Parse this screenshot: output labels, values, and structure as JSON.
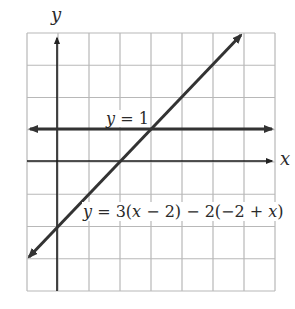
{
  "chart_data": {
    "type": "line",
    "title": "",
    "xlabel": "x",
    "ylabel": "y",
    "xlim": [
      -1,
      7
    ],
    "ylim": [
      -4,
      4
    ],
    "grid": true,
    "grid_step": 1,
    "tick_labels": false,
    "series": [
      {
        "name": "y = 1",
        "label": "y = 1",
        "equation": "y = 1",
        "points": [
          [
            -1,
            1
          ],
          [
            7,
            1
          ]
        ],
        "style": "bold line, arrows both ends"
      },
      {
        "name": "y = 3(x − 2) − 2(−2 + x)",
        "label": "y = 3(x − 2) − 2(−2 + x)",
        "equation": "y = x - 2",
        "points": [
          [
            -1,
            -3
          ],
          [
            6,
            4
          ]
        ],
        "style": "bold line, arrows both ends"
      }
    ],
    "annotations": [
      {
        "text": "y = 1",
        "near": [
          2.5,
          1.3
        ]
      },
      {
        "text": "y = 3(x − 2) − 2(−2 + x)",
        "near": [
          4.3,
          -1.7
        ]
      }
    ],
    "intersection": [
      3,
      1
    ]
  },
  "labels": {
    "x_axis": "x",
    "y_axis": "y",
    "line1": "y = 1",
    "line2_prefix": "y",
    "line2_rest": " = 3(",
    "line2_x1": "x",
    "line2_mid": " − 2) − 2(−2 + ",
    "line2_x2": "x",
    "line2_end": ")"
  },
  "colors": {
    "grid": "#b8b8b8",
    "axis": "#1a1a1a",
    "line": "#333333",
    "text": "#2a2a2a"
  }
}
